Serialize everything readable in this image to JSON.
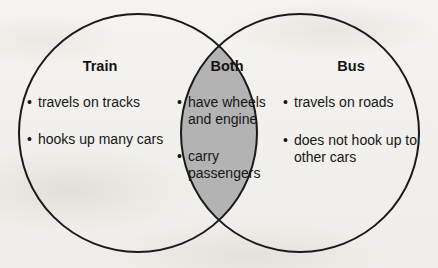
{
  "diagram": {
    "type": "venn",
    "background_color": "#f3f2ef",
    "stroke_color": "#1a1a1a",
    "overlap_fill_color": "#b3b3b3",
    "text_color": "#161616",
    "left": {
      "title": "Train",
      "items": [
        "travels on tracks",
        "hooks up many cars"
      ]
    },
    "center": {
      "title": "Both",
      "items": [
        "have wheels and engine",
        "carry passengers"
      ]
    },
    "right": {
      "title": "Bus",
      "items": [
        "travels on roads",
        "does not hook up to other cars"
      ]
    },
    "bullet_glyph": "•"
  }
}
